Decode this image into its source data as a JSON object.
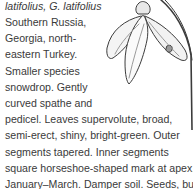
{
  "entry": {
    "synonyms_line": "latifolius, G. latifolius",
    "narrow_lines": [
      "Southern Russia,",
      "Georgia, north-",
      "eastern Turkey.",
      "Smaller species",
      "snowdrop. Gently",
      "curved spathe and"
    ],
    "wide_lines": [
      "pedicel. Leaves supervolute, broad,",
      "semi-erect, shiny, bright-green. Outer",
      "segments tapered. Inner segments",
      "square horseshoe-shaped mark at apex.",
      "January–March. Damper soil. Seeds, bulks",
      "up well when established. Named by A.S."
    ]
  },
  "illustration": {
    "subject": "snowdrop flower drawing",
    "stroke_color": "#3c3c3c"
  }
}
